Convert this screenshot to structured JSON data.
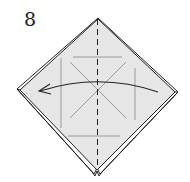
{
  "step": {
    "number": "8"
  },
  "colors": {
    "paper_fill": "#e6e6e6",
    "outline": "#222222",
    "crease": "#9a9a9a",
    "arrow": "#222222"
  },
  "diagram": {
    "fold_line": "vertical-dashed-center",
    "arrow_direction": "right-to-left"
  }
}
